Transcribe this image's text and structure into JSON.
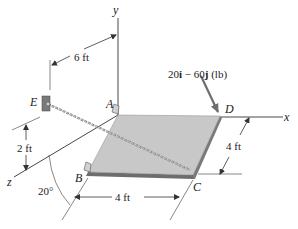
{
  "figure": {
    "points": {
      "A": "A",
      "B": "B",
      "C": "C",
      "D": "D",
      "E": "E"
    },
    "axes": {
      "x": "x",
      "y": "y",
      "z": "z"
    },
    "force_label": "20i − 60j (lb)",
    "force_label_parts": {
      "coef1": "20",
      "unit1": "i",
      "op": " − ",
      "coef2": "60",
      "unit2": "j",
      "units": " (lb)"
    },
    "dimensions": {
      "e_to_y_axis": "6 ft",
      "e_height": "2 ft",
      "plate_depth": "4 ft",
      "plate_width": "4 ft",
      "angle": "20°"
    },
    "colors": {
      "plate_top": "#c8c8c8",
      "plate_edge": "#6d6d6d",
      "force_arrow": "#6e6e6e",
      "lines": "#333333",
      "cable": "#8a8a8a"
    }
  }
}
